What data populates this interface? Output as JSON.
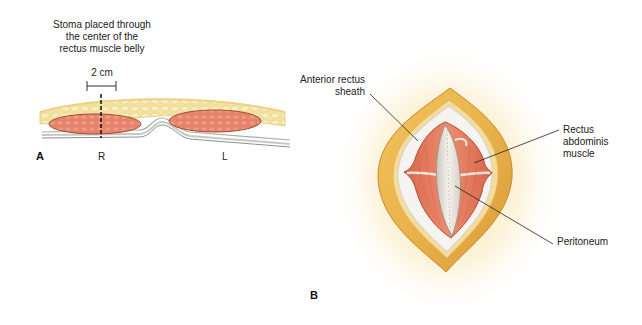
{
  "figure": {
    "panel_a": {
      "letter": "A",
      "caption_lines": [
        "Stoma placed through",
        "the center of the",
        "rectus muscle belly"
      ],
      "scale_label": "2 cm",
      "side_right": "R",
      "side_left": "L"
    },
    "panel_b": {
      "letter": "B",
      "labels": {
        "anterior_sheath_line1": "Anterior rectus",
        "anterior_sheath_line2": "sheath",
        "rectus_line1": "Rectus",
        "rectus_line2": "abdominis",
        "rectus_line3": "muscle",
        "peritoneum": "Peritoneum"
      }
    },
    "colors": {
      "fat": "#f2e09a",
      "fat_dark": "#d9a640",
      "muscle": "#e0735a",
      "muscle_light": "#f0a48a",
      "fascia": "#c9ccc4",
      "sheath_white": "#f4f2ee",
      "peritoneum": "#e9e4dc",
      "glow": "#fbf0cf"
    }
  }
}
